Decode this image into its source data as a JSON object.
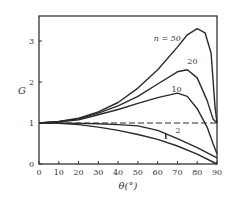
{
  "chart_data": {
    "type": "line",
    "title": "",
    "xlabel": "θ(°)",
    "ylabel": "G",
    "xlim": [
      0,
      90
    ],
    "ylim": [
      0,
      3.5
    ],
    "xticks": [
      0,
      10,
      20,
      30,
      40,
      50,
      60,
      70,
      80,
      90
    ],
    "yticks": [
      0,
      1,
      2,
      3
    ],
    "grid": false,
    "legend": "inline annotations",
    "series": [
      {
        "name": "n=50",
        "label": "n = 50",
        "x": [
          0,
          10,
          20,
          30,
          40,
          50,
          60,
          70,
          75,
          80,
          84,
          87,
          89,
          90
        ],
        "y": [
          1.0,
          1.04,
          1.12,
          1.27,
          1.5,
          1.85,
          2.3,
          2.85,
          3.15,
          3.3,
          3.2,
          2.7,
          1.4,
          1.0
        ]
      },
      {
        "name": "n=20",
        "label": "20",
        "x": [
          0,
          10,
          20,
          30,
          40,
          50,
          60,
          70,
          75,
          80,
          85,
          88,
          90
        ],
        "y": [
          1.0,
          1.03,
          1.1,
          1.24,
          1.42,
          1.65,
          1.95,
          2.25,
          2.3,
          2.1,
          1.55,
          1.1,
          1.0
        ]
      },
      {
        "name": "n=10",
        "label": "10",
        "x": [
          0,
          10,
          20,
          30,
          40,
          50,
          60,
          70,
          75,
          80,
          85,
          88,
          90
        ],
        "y": [
          1.0,
          1.03,
          1.08,
          1.2,
          1.33,
          1.48,
          1.62,
          1.73,
          1.65,
          1.35,
          0.9,
          0.5,
          0.25
        ]
      },
      {
        "name": "n=2",
        "label": "2",
        "x": [
          0,
          10,
          20,
          30,
          40,
          50,
          60,
          70,
          80,
          90
        ],
        "y": [
          1.0,
          1.0,
          0.99,
          0.98,
          0.96,
          0.93,
          0.82,
          0.62,
          0.4,
          0.15
        ]
      },
      {
        "name": "n=1",
        "label": "1",
        "x": [
          0,
          10,
          20,
          30,
          40,
          50,
          60,
          70,
          80,
          90
        ],
        "y": [
          1.0,
          0.99,
          0.96,
          0.9,
          0.82,
          0.72,
          0.6,
          0.44,
          0.24,
          0.0
        ]
      },
      {
        "name": "reference G=1",
        "label": "",
        "style": "dashed",
        "x": [
          0,
          90
        ],
        "y": [
          1.0,
          1.0
        ]
      }
    ],
    "annotations": [
      {
        "text": "n = 50",
        "x": 58,
        "y": 3.0
      },
      {
        "text": "20",
        "x": 75,
        "y": 2.45
      },
      {
        "text": "10",
        "x": 67,
        "y": 1.75
      },
      {
        "text": "2",
        "x": 69,
        "y": 0.75
      },
      {
        "text": "1",
        "x": 63,
        "y": 0.6
      }
    ]
  }
}
